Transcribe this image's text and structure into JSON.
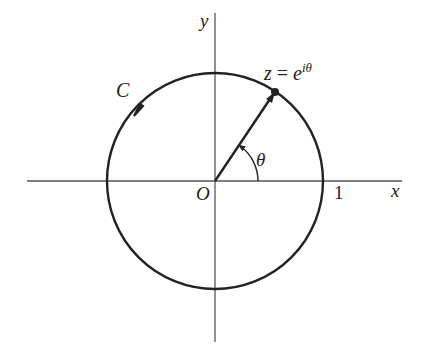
{
  "diagram": {
    "colors": {
      "ink": "#222222",
      "axis": "#555555",
      "background": "#ffffff"
    },
    "axes": {
      "x_label": "x",
      "y_label": "y",
      "origin_label": "O",
      "unit_tick_label": "1"
    },
    "contour": {
      "label": "C",
      "shape": "circle",
      "radius": 1,
      "orientation": "counterclockwise"
    },
    "point": {
      "label_lhs": "z",
      "label_eq": " = ",
      "label_base": "e",
      "label_exp": "iθ",
      "angle_deg": 56
    },
    "angle": {
      "label": "θ"
    }
  }
}
